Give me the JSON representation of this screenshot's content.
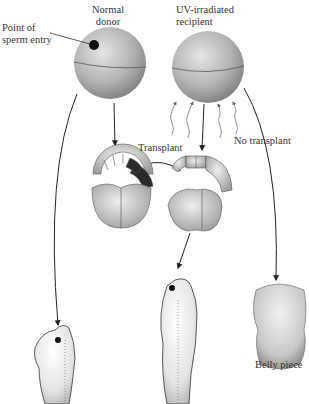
{
  "labels": {
    "donor_line1": "Normal",
    "donor_line2": "donor",
    "sperm_line1": "Point of",
    "sperm_line2": "sperm entry",
    "recipient_line1": "UV-irradiated",
    "recipient_line2": "recipient",
    "transplant": "Transplant",
    "no_transplant": "No transplant",
    "belly_piece": "Belly piece"
  },
  "colors": {
    "egg_fill": "#b5b5b5",
    "embryo_cell": "#bdbdbd",
    "graft_dark": "#2a2a2a",
    "arrow": "#222222",
    "uv_rays": "#888888",
    "text": "#333333"
  }
}
